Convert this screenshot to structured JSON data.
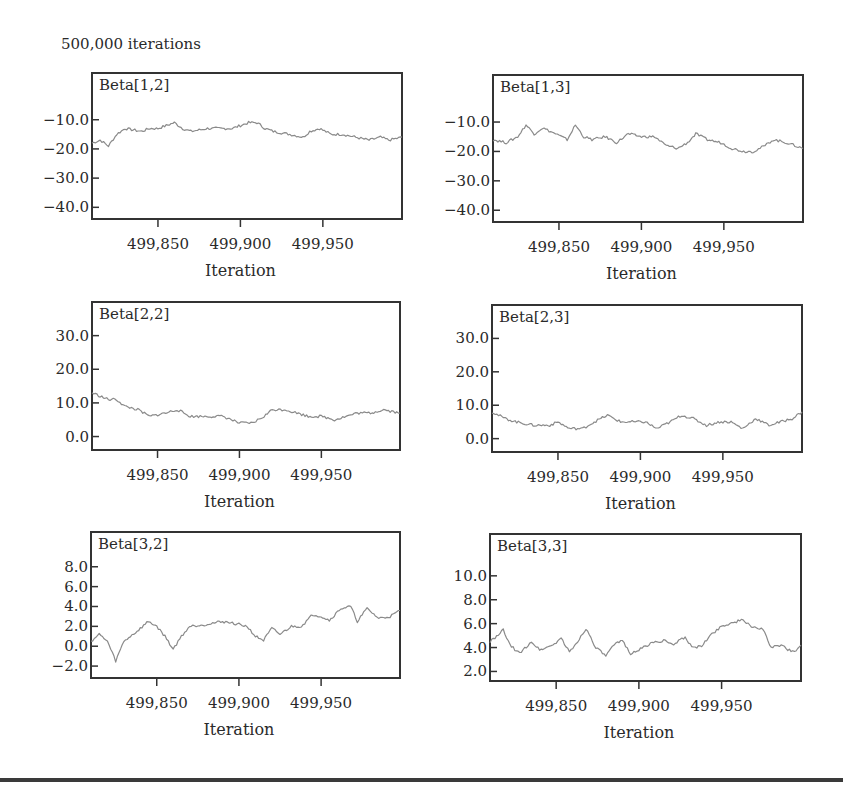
{
  "figure": {
    "title": "500,000 iterations",
    "xlabel": "Iteration",
    "x_ticks": [
      "499,850",
      "499,900",
      "499,950"
    ],
    "trace_color": "#8a8a8a",
    "frame_color": "#333333"
  },
  "chart_data": [
    {
      "type": "line",
      "title": "Beta[1,2]",
      "xlabel": "Iteration",
      "ylabel": "",
      "xlim": [
        499810,
        499998
      ],
      "ylim": [
        -44,
        6
      ],
      "y_ticks": [
        -10.0,
        -20.0,
        -30.0,
        -40.0
      ],
      "y_tick_labels": [
        "−10.0",
        "−20.0",
        "−30.0",
        "−40.0"
      ],
      "x_ticks": [
        499850,
        499900,
        499950
      ],
      "x": [
        499810,
        499815,
        499820,
        499825,
        499830,
        499840,
        499845,
        499850,
        499855,
        499860,
        499865,
        499870,
        499880,
        499890,
        499895,
        499900,
        499905,
        499910,
        499915,
        499920,
        499930,
        499938,
        499942,
        499948,
        499955,
        499962,
        499970,
        499978,
        499985,
        499990,
        499998
      ],
      "y": [
        -18,
        -17,
        -19,
        -15,
        -13,
        -14,
        -13,
        -13,
        -12,
        -11,
        -13,
        -14,
        -13,
        -13,
        -13,
        -12,
        -11,
        -11,
        -13,
        -14,
        -15,
        -16,
        -14,
        -13,
        -15,
        -15,
        -16,
        -17,
        -16,
        -17,
        -16
      ]
    },
    {
      "type": "line",
      "title": "Beta[1,3]",
      "xlabel": "Iteration",
      "ylabel": "",
      "xlim": [
        499810,
        499998
      ],
      "ylim": [
        -44,
        6
      ],
      "y_ticks": [
        -10.0,
        -20.0,
        -30.0,
        -40.0
      ],
      "y_tick_labels": [
        "−10.0",
        "−20.0",
        "−30.0",
        "−40.0"
      ],
      "x_ticks": [
        499850,
        499900,
        499950
      ],
      "x": [
        499810,
        499818,
        499825,
        499830,
        499835,
        499840,
        499848,
        499855,
        499860,
        499865,
        499870,
        499878,
        499885,
        499892,
        499900,
        499908,
        499915,
        499922,
        499928,
        499933,
        499940,
        499948,
        499955,
        499962,
        499968,
        499975,
        499980,
        499988,
        499998
      ],
      "y": [
        -16,
        -17,
        -15,
        -11,
        -14,
        -12,
        -14,
        -16,
        -11,
        -15,
        -16,
        -15,
        -17,
        -14,
        -15,
        -15,
        -18,
        -19,
        -17,
        -14,
        -16,
        -17,
        -19,
        -20,
        -20,
        -18,
        -16,
        -17,
        -19
      ]
    },
    {
      "type": "line",
      "title": "Beta[2,2]",
      "xlabel": "Iteration",
      "ylabel": "",
      "xlim": [
        499810,
        499998
      ],
      "ylim": [
        -4,
        40
      ],
      "y_ticks": [
        30.0,
        20.0,
        10.0,
        0.0
      ],
      "y_tick_labels": [
        "30.0",
        "20.0",
        "10.0",
        "0.0"
      ],
      "x_ticks": [
        499850,
        499900,
        499950
      ],
      "x": [
        499810,
        499815,
        499820,
        499825,
        499830,
        499838,
        499845,
        499855,
        499862,
        499870,
        499880,
        499890,
        499900,
        499908,
        499915,
        499920,
        499928,
        499935,
        499942,
        499950,
        499958,
        499965,
        499972,
        499980,
        499988,
        499998
      ],
      "y": [
        13,
        12,
        11,
        11,
        9,
        8,
        6,
        7,
        8,
        6,
        6,
        6,
        4,
        4,
        6,
        8,
        8,
        7,
        6,
        6,
        5,
        6,
        7,
        7,
        8,
        7
      ]
    },
    {
      "type": "line",
      "title": "Beta[2,3]",
      "xlabel": "Iteration",
      "ylabel": "",
      "xlim": [
        499810,
        499998
      ],
      "ylim": [
        -4,
        40
      ],
      "y_ticks": [
        30.0,
        20.0,
        10.0,
        0.0
      ],
      "y_tick_labels": [
        "30.0",
        "20.0",
        "10.0",
        "0.0"
      ],
      "x_ticks": [
        499850,
        499900,
        499950
      ],
      "x": [
        499810,
        499818,
        499825,
        499835,
        499845,
        499850,
        499857,
        499865,
        499872,
        499880,
        499888,
        499895,
        499903,
        499910,
        499918,
        499925,
        499932,
        499940,
        499948,
        499955,
        499962,
        499970,
        499978,
        499985,
        499992,
        499998
      ],
      "y": [
        8,
        6,
        5,
        4,
        4,
        5,
        3,
        3,
        5,
        7,
        5,
        5,
        5,
        3,
        5,
        7,
        6,
        4,
        5,
        5,
        3,
        6,
        4,
        5,
        6,
        8
      ]
    },
    {
      "type": "line",
      "title": "Beta[3,2]",
      "xlabel": "Iteration",
      "ylabel": "",
      "xlim": [
        499810,
        499998
      ],
      "ylim": [
        -3.2,
        11.5
      ],
      "y_ticks": [
        8.0,
        6.0,
        4.0,
        2.0,
        0.0,
        -2.0
      ],
      "y_tick_labels": [
        "8.0",
        "6.0",
        "4.0",
        "2.0",
        "0.0",
        "−2.0"
      ],
      "x_ticks": [
        499850,
        499900,
        499950
      ],
      "x": [
        499810,
        499815,
        499820,
        499825,
        499830,
        499838,
        499845,
        499850,
        499855,
        499860,
        499865,
        499870,
        499880,
        499890,
        499900,
        499905,
        499910,
        499915,
        499920,
        499925,
        499932,
        499938,
        499945,
        499950,
        499955,
        499962,
        499968,
        499972,
        499978,
        499985,
        499992,
        499998
      ],
      "y": [
        0.5,
        1.2,
        0.5,
        -1.5,
        0.5,
        1.5,
        2.5,
        2.0,
        1.0,
        -0.3,
        1.0,
        2.0,
        2.2,
        2.5,
        2.2,
        2.0,
        1.0,
        0.6,
        1.8,
        1.2,
        2.0,
        2.0,
        3.2,
        3.0,
        2.6,
        3.8,
        4.0,
        2.5,
        3.8,
        2.8,
        3.0,
        3.6
      ]
    },
    {
      "type": "line",
      "title": "Beta[3,3]",
      "xlabel": "Iteration",
      "ylabel": "",
      "xlim": [
        499810,
        499998
      ],
      "ylim": [
        1.2,
        13.5
      ],
      "y_ticks": [
        10.0,
        8.0,
        6.0,
        4.0,
        2.0
      ],
      "y_tick_labels": [
        "10.0",
        "8.0",
        "6.0",
        "4.0",
        "2.0"
      ],
      "x_ticks": [
        499850,
        499900,
        499950
      ],
      "x": [
        499810,
        499815,
        499818,
        499822,
        499828,
        499835,
        499840,
        499848,
        499853,
        499858,
        499863,
        499868,
        499874,
        499880,
        499885,
        499890,
        499895,
        499900,
        499908,
        499915,
        499920,
        499928,
        499932,
        499938,
        499943,
        499950,
        499955,
        499962,
        499968,
        499975,
        499980,
        499986,
        499990,
        499995,
        499998
      ],
      "y": [
        4.5,
        5.0,
        5.5,
        4.2,
        3.5,
        4.5,
        3.8,
        4.2,
        4.8,
        3.6,
        4.5,
        5.6,
        4.0,
        3.3,
        4.2,
        4.6,
        3.5,
        3.8,
        4.4,
        4.6,
        4.2,
        4.9,
        4.0,
        4.1,
        5.0,
        5.8,
        6.0,
        6.3,
        5.8,
        5.5,
        4.0,
        4.2,
        3.8,
        3.7,
        4.2
      ]
    }
  ]
}
